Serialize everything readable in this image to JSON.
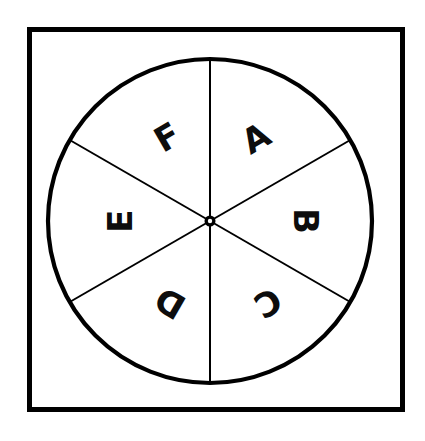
{
  "diagram": {
    "shape": "circle-divided-into-six-equal-sectors",
    "frame": {
      "name": "outer-square-border",
      "stroke_color": "#000000",
      "fill_color": "#ffffff"
    },
    "wheel": {
      "name": "spinner-wheel",
      "stroke_color": "#000000",
      "fill_color": "#ffffff",
      "center_x": 210,
      "center_y": 221,
      "radius": 162,
      "sector_count": 6,
      "sector_angle_degrees": 60
    },
    "hub": {
      "name": "spinner-hub",
      "color": "#000000",
      "radius": 5
    },
    "sectors": [
      {
        "label": "A",
        "position": "upper-right",
        "center_angle_deg": 30,
        "rotation_deg": -30,
        "label_x": 256,
        "label_y": 138
      },
      {
        "label": "B",
        "position": "right",
        "center_angle_deg": 90,
        "rotation_deg": 90,
        "label_x": 306,
        "label_y": 221
      },
      {
        "label": "C",
        "position": "lower-right",
        "center_angle_deg": 150,
        "rotation_deg": 150,
        "label_x": 268,
        "label_y": 303
      },
      {
        "label": "D",
        "position": "lower-left",
        "center_angle_deg": 210,
        "rotation_deg": 210,
        "label_x": 170,
        "label_y": 303
      },
      {
        "label": "E",
        "position": "left",
        "center_angle_deg": 270,
        "rotation_deg": 270,
        "label_x": 120,
        "label_y": 221
      },
      {
        "label": "F",
        "position": "upper-left",
        "center_angle_deg": 330,
        "rotation_deg": 330,
        "label_x": 167,
        "label_y": 137
      }
    ],
    "spokes": [
      {
        "name": "spoke-vertical",
        "angle_deg": 0
      },
      {
        "name": "spoke-diagonal-ne-sw",
        "angle_deg": 60
      },
      {
        "name": "spoke-diagonal-nw-se",
        "angle_deg": 120
      }
    ]
  }
}
